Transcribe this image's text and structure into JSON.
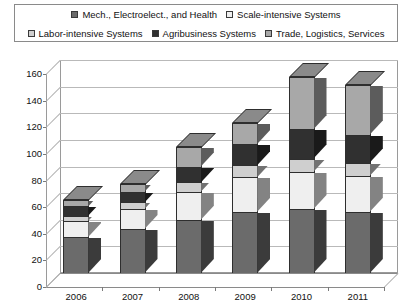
{
  "chart_data": {
    "type": "bar",
    "subtype": "stacked-3d-column",
    "title": "",
    "xlabel": "",
    "ylabel": "",
    "categories": [
      "2006",
      "2007",
      "2008",
      "2009",
      "2010",
      "2011"
    ],
    "ylim": [
      0,
      160
    ],
    "yticks": [
      0,
      20,
      40,
      60,
      80,
      100,
      120,
      140,
      160
    ],
    "grid": true,
    "legend_position": "top",
    "series": [
      {
        "name": "Mech., Electroelect., and Health",
        "marker": "dark-gray-square",
        "color": "#6b6b6b",
        "values": [
          27,
          33,
          40,
          46,
          48,
          46
        ]
      },
      {
        "name": "Scale-intensive Systems",
        "marker": "white-square",
        "color": "#efefef",
        "values": [
          12,
          15,
          21,
          26,
          28,
          27
        ]
      },
      {
        "name": "Labor-intensive Systems",
        "marker": "light-gray-square",
        "color": "#cfcfcf",
        "values": [
          4,
          5,
          7,
          9,
          10,
          10
        ]
      },
      {
        "name": "Agribusiness Systems",
        "marker": "black-square",
        "color": "#303030",
        "values": [
          7,
          8,
          12,
          16,
          22,
          21
        ]
      },
      {
        "name": "Trade, Logistics, Services",
        "marker": "gray-square",
        "color": "#a8a8a8",
        "values": [
          5,
          6,
          15,
          16,
          39,
          37
        ]
      }
    ],
    "totals": [
      55,
      67,
      95,
      113,
      147,
      141
    ],
    "colors": {
      "mech_electro_health": "#6b6b6b",
      "scale_intensive": "#efefef",
      "labor_intensive": "#cfcfcf",
      "agribusiness": "#303030",
      "trade_logistics": "#a8a8a8",
      "axis": "#9a9a9a",
      "gridline": "#b9b9b9",
      "text": "#111111",
      "background": "#ffffff"
    }
  },
  "legend": {
    "rows": [
      [
        {
          "label": "Mech., Electroelect., and Health",
          "marker": "dark-gray-square"
        },
        {
          "label": "Scale-intensive Systems",
          "marker": "white-square"
        }
      ],
      [
        {
          "label": "Labor-intensive Systems",
          "marker": "light-gray-square"
        },
        {
          "label": "Agribusiness Systems",
          "marker": "black-square"
        },
        {
          "label": "Trade, Logistics, Services",
          "marker": "gray-square"
        }
      ]
    ]
  }
}
